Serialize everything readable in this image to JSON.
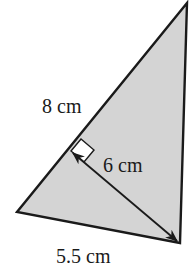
{
  "figure": {
    "type": "triangle-with-altitude",
    "fill_color": "#d4d4d4",
    "stroke_color": "#1a1a1a",
    "background": "#ffffff",
    "vertices": {
      "top": [
        187,
        3
      ],
      "bottom_left": [
        17,
        212
      ],
      "bottom_right": [
        180,
        243
      ]
    },
    "altitude": {
      "foot": [
        71,
        151
      ],
      "end": [
        178,
        242
      ],
      "right_angle_marker": true,
      "double_headed_arrow": true
    }
  },
  "labels": {
    "side_left": "8 cm",
    "altitude": "6 cm",
    "base": "5.5 cm"
  }
}
